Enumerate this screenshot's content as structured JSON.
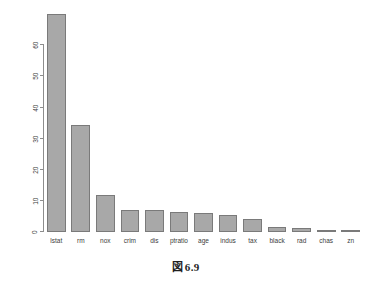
{
  "figure": {
    "caption_symbol": "図",
    "caption_number": "6.9",
    "background_color": "#ffffff"
  },
  "chart_data": {
    "type": "bar",
    "title": "",
    "xlabel": "",
    "ylabel": "",
    "categories": [
      "lstat",
      "rm",
      "nox",
      "crim",
      "dis",
      "ptratio",
      "age",
      "indus",
      "tax",
      "black",
      "rad",
      "chas",
      "zn"
    ],
    "values": [
      70,
      34.5,
      12,
      7.2,
      7,
      6.4,
      6,
      5.6,
      4.3,
      1.5,
      1.2,
      0.5,
      0.2
    ],
    "ylim": [
      0,
      72
    ],
    "yticks": [
      0,
      10,
      20,
      30,
      40,
      50,
      60
    ],
    "ytick_labels": [
      "0",
      "10",
      "20",
      "30",
      "40",
      "50",
      "60"
    ],
    "ytick_label_rotation": -90,
    "grid": false,
    "legend": false,
    "bar_fill_color": "#a8a8a8",
    "bar_border_color": "#7a7a7a",
    "axis_color": "#8d8d8d"
  }
}
